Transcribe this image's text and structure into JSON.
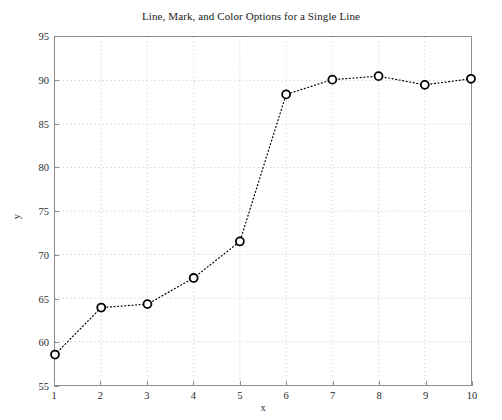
{
  "chart_data": {
    "type": "line",
    "title": "Line, Mark, and Color Options for a Single Line",
    "xlabel": "x",
    "ylabel": "y",
    "x": [
      1,
      2,
      3,
      4,
      5,
      6,
      7,
      8,
      9,
      10
    ],
    "values": [
      58.5,
      63.9,
      64.3,
      67.3,
      71.5,
      88.4,
      90.1,
      90.5,
      89.5,
      90.2
    ],
    "series": [
      {
        "name": "Single Line",
        "x": [
          1,
          2,
          3,
          4,
          5,
          6,
          7,
          8,
          9,
          10
        ],
        "values": [
          58.5,
          63.9,
          64.3,
          67.3,
          71.5,
          88.4,
          90.1,
          90.5,
          89.5,
          90.2
        ],
        "line_style": "dotted",
        "marker": "circle-open",
        "color": "#000000"
      }
    ],
    "xlim": [
      1,
      10
    ],
    "ylim": [
      55,
      95
    ],
    "xticks": [
      1,
      2,
      3,
      4,
      5,
      6,
      7,
      8,
      9,
      10
    ],
    "yticks": [
      55,
      60,
      65,
      70,
      75,
      80,
      85,
      90,
      95
    ],
    "xtick_labels": [
      "1",
      "2",
      "3",
      "4",
      "5",
      "6",
      "7",
      "8",
      "9",
      "10"
    ],
    "ytick_labels": [
      "55",
      "60",
      "65",
      "70",
      "75",
      "80",
      "85",
      "90",
      "95"
    ],
    "grid": true,
    "grid_style": "dotted",
    "grid_color": "#c8c8c8",
    "legend": null,
    "axis_color": "#8d8d8d",
    "background": "#ffffff",
    "text_color": "#2b2b2b"
  }
}
